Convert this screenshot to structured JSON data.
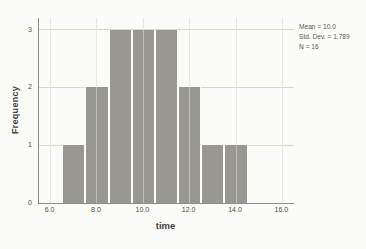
{
  "figure": {
    "bg_color": "#fbfbf8",
    "bar_color": "#999792",
    "grid_color": "#d9d9d4",
    "axis_color": "#8d8d89",
    "tick_text_color": "#4e4e4b",
    "title_text_color": "#3f3f3d",
    "stats_text_color": "#5a5a57"
  },
  "chart_data": {
    "type": "bar",
    "chart_kind": "histogram",
    "title": "",
    "xlabel": "time",
    "ylabel": "Frequency",
    "xlim": [
      5.5,
      16.5
    ],
    "ylim": [
      0,
      3.2
    ],
    "x_ticks": [
      6.0,
      8.0,
      10.0,
      12.0,
      14.0,
      16.0
    ],
    "x_tick_labels": [
      "6.0",
      "8.0",
      "10.0",
      "12.0",
      "14.0",
      "16.0"
    ],
    "y_ticks": [
      0,
      1,
      2,
      3
    ],
    "y_tick_labels": [
      "0",
      "1",
      "2",
      "3"
    ],
    "grid": true,
    "legend_position": "none",
    "bin_width": 1.0,
    "bins": [
      {
        "start": 6.5,
        "end": 7.5,
        "count": 1
      },
      {
        "start": 7.5,
        "end": 8.5,
        "count": 2
      },
      {
        "start": 8.5,
        "end": 9.5,
        "count": 3
      },
      {
        "start": 9.5,
        "end": 10.5,
        "count": 3
      },
      {
        "start": 10.5,
        "end": 11.5,
        "count": 3
      },
      {
        "start": 11.5,
        "end": 12.5,
        "count": 2
      },
      {
        "start": 12.5,
        "end": 13.5,
        "count": 1
      },
      {
        "start": 13.5,
        "end": 14.5,
        "count": 1
      }
    ],
    "stats": {
      "mean_label": "Mean = 10.0",
      "std_dev_label": "Std. Dev. = 1.789",
      "n_label": "N = 16"
    }
  }
}
